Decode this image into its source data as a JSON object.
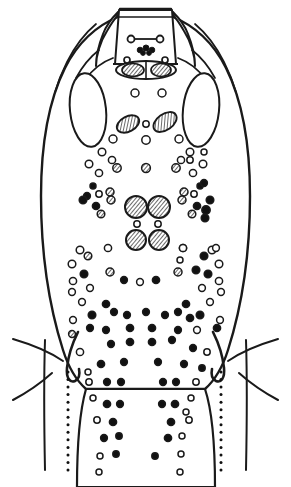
{
  "figure": {
    "caption": "",
    "type": "scientific-line-drawing",
    "background_color": "#ffffff",
    "ink_color": "#1a1a1a",
    "fill_color": "#ffffff",
    "canvas": {
      "width": 291,
      "height": 487
    }
  },
  "style": {
    "stroke": "#1a1a1a",
    "stroke_light": "#2b2b2b",
    "fill_white": "#ffffff",
    "fill_black": "#111111",
    "hatch_stroke": "#1a1a1a",
    "outline_width": 2.2,
    "inner_width": 1.7,
    "dot_stroke_width": 1.5,
    "appendage_width": 2.0
  },
  "body_outline": {
    "name": "idiosoma-outline",
    "path": "M 120 16 L 120 9 L 171 9 L 171 16 C 196 26 214 44 226 68 C 243 102 250 148 250 196 C 250 252 242 306 228 350 C 222 369 214 381 205 389 L 86 389 C 77 381 69 369 63 350 C 49 306 41 252 41 196 C 41 148 48 102 65 68 C 77 44 95 26 120 16 Z"
  },
  "head_plate": {
    "name": "head-plate",
    "path": "M 119 10 L 172 10 L 176 64 L 115 64 Z",
    "top_rim_path": "M 118 17 L 173 17",
    "neck_path": "M 113 64 L 178 64"
  },
  "antennae": [
    {
      "name": "antenna-left",
      "path": "M 118 12 C 112 18 106 26 103 34 C 99 44 96 56 96 66 C 96 56 100 42 107 31 C 111 24 115 18 119 14 Z"
    },
    {
      "name": "antenna-right",
      "path": "M 173 12 C 179 18 185 26 188 34 C 192 44 195 56 195 66 C 195 56 191 42 184 31 C 180 24 176 18 172 14 Z"
    }
  ],
  "shoulder_lines": [
    {
      "name": "shoulder-ridge-left",
      "path": "M 96 24 C 84 34 74 48 67 62 C 62 72 58 82 55 92"
    },
    {
      "name": "shoulder-ridge-right",
      "path": "M 195 24 C 207 34 217 48 224 62 C 229 72 233 82 236 92"
    },
    {
      "name": "shoulder-inner-left",
      "path": "M 99 50 C 90 57 82 67 76 78"
    },
    {
      "name": "shoulder-inner-right",
      "path": "M 192 50 C 201 57 209 67 215 78"
    },
    {
      "name": "clavicle-left",
      "path": "M 113 58 C 102 62 92 70 85 80"
    },
    {
      "name": "clavicle-right",
      "path": "M 178 58 C 189 62 199 70 206 80"
    }
  ],
  "eye_ovals": [
    {
      "name": "dorsal-oval-left",
      "cx": 88,
      "cy": 110,
      "rx": 18,
      "ry": 37,
      "rotation": -6
    },
    {
      "name": "dorsal-oval-right",
      "cx": 201,
      "cy": 110,
      "rx": 18,
      "ry": 37,
      "rotation": 6
    }
  ],
  "head_capsule": {
    "name": "mouthpart-capsule",
    "cx": 146,
    "cy": 70,
    "rx": 30,
    "ry": 9,
    "divider_path": "M 146 62 L 146 78",
    "inner_hatched": [
      {
        "name": "capsule-scutum-left",
        "cx": 133,
        "cy": 70,
        "rx": 11,
        "ry": 6.5,
        "rotation": 0
      },
      {
        "name": "capsule-scutum-right",
        "cx": 161,
        "cy": 70,
        "rx": 10,
        "ry": 6.5,
        "rotation": 0
      }
    ]
  },
  "head_features": {
    "paired_circles": [
      {
        "name": "head-pore-left",
        "cx": 131,
        "cy": 39,
        "r": 3.5
      },
      {
        "name": "head-pore-right",
        "cx": 160,
        "cy": 39,
        "r": 3.5
      }
    ],
    "connector_path": "M 134 39 L 157 39",
    "dark_cluster": [
      {
        "cx": 140,
        "cy": 50,
        "r": 2.8
      },
      {
        "cx": 146,
        "cy": 48,
        "r": 3.0
      },
      {
        "cx": 152,
        "cy": 50,
        "r": 2.8
      },
      {
        "cx": 143,
        "cy": 53,
        "r": 2.4
      },
      {
        "cx": 149,
        "cy": 53,
        "r": 2.4
      }
    ],
    "sub_pores": [
      {
        "cx": 127,
        "cy": 60,
        "r": 3.0
      },
      {
        "cx": 165,
        "cy": 60,
        "r": 3.0
      }
    ]
  },
  "mid_hatched_ovals": [
    {
      "name": "hatched-oval-left",
      "cx": 128,
      "cy": 124,
      "rx": 12,
      "ry": 7.5,
      "rotation": -28
    },
    {
      "name": "hatched-oval-right",
      "cx": 165,
      "cy": 122,
      "rx": 13,
      "ry": 8.0,
      "rotation": -35
    }
  ],
  "central_hatched_circles": [
    {
      "name": "central-disc-upper-left",
      "cx": 136,
      "cy": 207,
      "r": 11
    },
    {
      "name": "central-disc-upper-right",
      "cx": 159,
      "cy": 207,
      "r": 11
    },
    {
      "name": "central-disc-lower-left",
      "cx": 136,
      "cy": 240,
      "r": 10
    },
    {
      "name": "central-disc-lower-right",
      "cx": 159,
      "cy": 240,
      "r": 10
    }
  ],
  "anal_groove": {
    "name": "anal-groove",
    "path": "M 146 373 C 140 379 136 392 135 410 C 134 434 133 462 133 485 M 146 373 C 152 379 156 392 157 410 C 158 434 159 462 159 485"
  },
  "lateral_hooks": [
    {
      "name": "coxal-hook-left",
      "path": "M 78 332 C 72 344 68 358 67 368 C 66 378 70 383 75 381 C 79 379 80 374 79 369"
    },
    {
      "name": "coxal-hook-right",
      "path": "M 213 332 C 219 344 223 358 224 368 C 225 378 221 383 216 381 C 212 379 211 374 212 369"
    }
  ],
  "lobe_edges": [
    {
      "name": "lobe-edge-left",
      "path": "M 45 340 C 44 372 44 420 45 470"
    },
    {
      "name": "lobe-edge-right",
      "path": "M 246 340 C 247 372 247 420 246 470"
    }
  ],
  "appendage_lines": [
    {
      "name": "seta-upper-left",
      "path": "M 13 339 C 30 344 50 352 63 361"
    },
    {
      "name": "seta-lower-left",
      "path": "M 13 400 C 28 392 42 382 52 373"
    },
    {
      "name": "seta-upper-right",
      "path": "M 278 339 C 261 344 241 352 228 361"
    },
    {
      "name": "seta-lower-right",
      "path": "M 278 400 C 263 392 249 382 239 373"
    }
  ],
  "dotted_guides": [
    {
      "name": "dotted-guide-left",
      "x": 68,
      "y_start": 372,
      "y_end": 470,
      "count": 14,
      "r": 1.5
    },
    {
      "name": "dotted-guide-right",
      "x": 221,
      "y_start": 372,
      "y_end": 470,
      "count": 14,
      "r": 1.5
    }
  ],
  "setae_dots": [
    {
      "cx": 135,
      "cy": 93,
      "r": 4.0,
      "kind": "open"
    },
    {
      "cx": 162,
      "cy": 93,
      "r": 4.0,
      "kind": "open"
    },
    {
      "cx": 146,
      "cy": 124,
      "r": 3.2,
      "kind": "open"
    },
    {
      "cx": 113,
      "cy": 139,
      "r": 4.0,
      "kind": "open"
    },
    {
      "cx": 146,
      "cy": 140,
      "r": 4.2,
      "kind": "open"
    },
    {
      "cx": 179,
      "cy": 139,
      "r": 4.0,
      "kind": "open"
    },
    {
      "cx": 102,
      "cy": 152,
      "r": 3.8,
      "kind": "open"
    },
    {
      "cx": 190,
      "cy": 152,
      "r": 3.8,
      "kind": "open"
    },
    {
      "cx": 112,
      "cy": 160,
      "r": 3.6,
      "kind": "open"
    },
    {
      "cx": 181,
      "cy": 160,
      "r": 3.6,
      "kind": "open"
    },
    {
      "cx": 89,
      "cy": 164,
      "r": 3.8,
      "kind": "open"
    },
    {
      "cx": 203,
      "cy": 164,
      "r": 3.8,
      "kind": "open"
    },
    {
      "cx": 117,
      "cy": 168,
      "r": 4.2,
      "kind": "hatch"
    },
    {
      "cx": 176,
      "cy": 168,
      "r": 4.2,
      "kind": "hatch"
    },
    {
      "cx": 146,
      "cy": 168,
      "r": 4.4,
      "kind": "hatch"
    },
    {
      "cx": 99,
      "cy": 173,
      "r": 3.6,
      "kind": "open"
    },
    {
      "cx": 193,
      "cy": 173,
      "r": 3.6,
      "kind": "open"
    },
    {
      "cx": 190,
      "cy": 160,
      "r": 3.2,
      "kind": "open"
    },
    {
      "cx": 204,
      "cy": 152,
      "r": 3.0,
      "kind": "open"
    },
    {
      "cx": 93,
      "cy": 186,
      "r": 3.0,
      "kind": "solid"
    },
    {
      "cx": 200,
      "cy": 186,
      "r": 3.0,
      "kind": "solid"
    },
    {
      "cx": 99,
      "cy": 194,
      "r": 3.2,
      "kind": "open"
    },
    {
      "cx": 194,
      "cy": 194,
      "r": 3.2,
      "kind": "open"
    },
    {
      "cx": 110,
      "cy": 192,
      "r": 4.0,
      "kind": "hatch"
    },
    {
      "cx": 184,
      "cy": 192,
      "r": 4.0,
      "kind": "hatch"
    },
    {
      "cx": 204,
      "cy": 183,
      "r": 3.4,
      "kind": "solid"
    },
    {
      "cx": 87,
      "cy": 196,
      "r": 3.4,
      "kind": "solid"
    },
    {
      "cx": 83,
      "cy": 200,
      "r": 3.8,
      "kind": "solid"
    },
    {
      "cx": 210,
      "cy": 200,
      "r": 3.8,
      "kind": "solid"
    },
    {
      "cx": 111,
      "cy": 200,
      "r": 4.0,
      "kind": "hatch"
    },
    {
      "cx": 182,
      "cy": 200,
      "r": 4.0,
      "kind": "hatch"
    },
    {
      "cx": 96,
      "cy": 206,
      "r": 3.6,
      "kind": "solid"
    },
    {
      "cx": 197,
      "cy": 206,
      "r": 3.6,
      "kind": "solid"
    },
    {
      "cx": 101,
      "cy": 214,
      "r": 3.8,
      "kind": "hatch"
    },
    {
      "cx": 192,
      "cy": 214,
      "r": 3.8,
      "kind": "hatch"
    },
    {
      "cx": 206,
      "cy": 210,
      "r": 4.2,
      "kind": "solid"
    },
    {
      "cx": 205,
      "cy": 218,
      "r": 3.8,
      "kind": "solid"
    },
    {
      "cx": 137,
      "cy": 224,
      "r": 3.2,
      "kind": "open"
    },
    {
      "cx": 158,
      "cy": 224,
      "r": 3.2,
      "kind": "open"
    },
    {
      "cx": 80,
      "cy": 250,
      "r": 3.8,
      "kind": "open"
    },
    {
      "cx": 212,
      "cy": 250,
      "r": 3.8,
      "kind": "open"
    },
    {
      "cx": 108,
      "cy": 248,
      "r": 3.6,
      "kind": "open"
    },
    {
      "cx": 183,
      "cy": 248,
      "r": 3.6,
      "kind": "open"
    },
    {
      "cx": 183,
      "cy": 248,
      "r": 3.6,
      "kind": "open"
    },
    {
      "cx": 72,
      "cy": 264,
      "r": 3.8,
      "kind": "open"
    },
    {
      "cx": 219,
      "cy": 264,
      "r": 3.8,
      "kind": "open"
    },
    {
      "cx": 88,
      "cy": 256,
      "r": 3.8,
      "kind": "hatch"
    },
    {
      "cx": 204,
      "cy": 256,
      "r": 3.8,
      "kind": "solid"
    },
    {
      "cx": 216,
      "cy": 248,
      "r": 3.4,
      "kind": "open"
    },
    {
      "cx": 180,
      "cy": 260,
      "r": 3.0,
      "kind": "open"
    },
    {
      "cx": 84,
      "cy": 274,
      "r": 3.8,
      "kind": "solid"
    },
    {
      "cx": 208,
      "cy": 274,
      "r": 3.8,
      "kind": "solid"
    },
    {
      "cx": 73,
      "cy": 281,
      "r": 3.6,
      "kind": "open"
    },
    {
      "cx": 219,
      "cy": 281,
      "r": 3.6,
      "kind": "open"
    },
    {
      "cx": 110,
      "cy": 272,
      "r": 4.0,
      "kind": "hatch"
    },
    {
      "cx": 178,
      "cy": 272,
      "r": 4.0,
      "kind": "hatch"
    },
    {
      "cx": 196,
      "cy": 270,
      "r": 3.8,
      "kind": "solid"
    },
    {
      "cx": 124,
      "cy": 280,
      "r": 3.4,
      "kind": "solid"
    },
    {
      "cx": 140,
      "cy": 282,
      "r": 3.4,
      "kind": "open"
    },
    {
      "cx": 156,
      "cy": 280,
      "r": 3.6,
      "kind": "solid"
    },
    {
      "cx": 90,
      "cy": 288,
      "r": 3.4,
      "kind": "open"
    },
    {
      "cx": 202,
      "cy": 288,
      "r": 3.4,
      "kind": "open"
    },
    {
      "cx": 72,
      "cy": 292,
      "r": 3.4,
      "kind": "open"
    },
    {
      "cx": 221,
      "cy": 292,
      "r": 3.4,
      "kind": "open"
    },
    {
      "cx": 106,
      "cy": 304,
      "r": 3.6,
      "kind": "solid"
    },
    {
      "cx": 186,
      "cy": 304,
      "r": 3.6,
      "kind": "solid"
    },
    {
      "cx": 82,
      "cy": 302,
      "r": 3.4,
      "kind": "open"
    },
    {
      "cx": 210,
      "cy": 302,
      "r": 3.4,
      "kind": "open"
    },
    {
      "cx": 92,
      "cy": 315,
      "r": 3.8,
      "kind": "solid"
    },
    {
      "cx": 200,
      "cy": 315,
      "r": 3.8,
      "kind": "solid"
    },
    {
      "cx": 114,
      "cy": 312,
      "r": 3.4,
      "kind": "solid"
    },
    {
      "cx": 178,
      "cy": 312,
      "r": 3.4,
      "kind": "solid"
    },
    {
      "cx": 127,
      "cy": 315,
      "r": 3.4,
      "kind": "solid"
    },
    {
      "cx": 165,
      "cy": 315,
      "r": 3.4,
      "kind": "solid"
    },
    {
      "cx": 146,
      "cy": 312,
      "r": 3.4,
      "kind": "solid"
    },
    {
      "cx": 190,
      "cy": 318,
      "r": 3.6,
      "kind": "solid"
    },
    {
      "cx": 73,
      "cy": 320,
      "r": 3.4,
      "kind": "open"
    },
    {
      "cx": 220,
      "cy": 320,
      "r": 3.4,
      "kind": "open"
    },
    {
      "cx": 130,
      "cy": 328,
      "r": 3.6,
      "kind": "solid"
    },
    {
      "cx": 152,
      "cy": 328,
      "r": 3.6,
      "kind": "solid"
    },
    {
      "cx": 106,
      "cy": 330,
      "r": 3.4,
      "kind": "solid"
    },
    {
      "cx": 178,
      "cy": 330,
      "r": 3.4,
      "kind": "solid"
    },
    {
      "cx": 197,
      "cy": 330,
      "r": 3.4,
      "kind": "open"
    },
    {
      "cx": 217,
      "cy": 328,
      "r": 3.6,
      "kind": "solid"
    },
    {
      "cx": 72,
      "cy": 334,
      "r": 3.4,
      "kind": "hatch"
    },
    {
      "cx": 90,
      "cy": 328,
      "r": 3.4,
      "kind": "solid"
    },
    {
      "cx": 130,
      "cy": 342,
      "r": 3.6,
      "kind": "solid"
    },
    {
      "cx": 152,
      "cy": 342,
      "r": 3.6,
      "kind": "solid"
    },
    {
      "cx": 172,
      "cy": 340,
      "r": 3.4,
      "kind": "solid"
    },
    {
      "cx": 111,
      "cy": 344,
      "r": 3.4,
      "kind": "solid"
    },
    {
      "cx": 193,
      "cy": 348,
      "r": 3.4,
      "kind": "solid"
    },
    {
      "cx": 207,
      "cy": 352,
      "r": 3.2,
      "kind": "open"
    },
    {
      "cx": 80,
      "cy": 352,
      "r": 3.6,
      "kind": "open"
    },
    {
      "cx": 101,
      "cy": 364,
      "r": 3.6,
      "kind": "solid"
    },
    {
      "cx": 124,
      "cy": 362,
      "r": 3.4,
      "kind": "solid"
    },
    {
      "cx": 158,
      "cy": 362,
      "r": 3.4,
      "kind": "solid"
    },
    {
      "cx": 184,
      "cy": 364,
      "r": 3.4,
      "kind": "solid"
    },
    {
      "cx": 202,
      "cy": 368,
      "r": 3.2,
      "kind": "solid"
    },
    {
      "cx": 88,
      "cy": 372,
      "r": 3.0,
      "kind": "open"
    },
    {
      "cx": 89,
      "cy": 382,
      "r": 3.2,
      "kind": "open"
    },
    {
      "cx": 107,
      "cy": 382,
      "r": 3.4,
      "kind": "solid"
    },
    {
      "cx": 121,
      "cy": 382,
      "r": 3.4,
      "kind": "solid"
    },
    {
      "cx": 163,
      "cy": 382,
      "r": 3.4,
      "kind": "solid"
    },
    {
      "cx": 176,
      "cy": 382,
      "r": 3.4,
      "kind": "solid"
    },
    {
      "cx": 196,
      "cy": 382,
      "r": 3.2,
      "kind": "open"
    },
    {
      "cx": 107,
      "cy": 404,
      "r": 3.6,
      "kind": "solid"
    },
    {
      "cx": 120,
      "cy": 404,
      "r": 3.4,
      "kind": "solid"
    },
    {
      "cx": 162,
      "cy": 404,
      "r": 3.4,
      "kind": "solid"
    },
    {
      "cx": 175,
      "cy": 404,
      "r": 3.6,
      "kind": "solid"
    },
    {
      "cx": 93,
      "cy": 398,
      "r": 3.0,
      "kind": "open"
    },
    {
      "cx": 191,
      "cy": 398,
      "r": 3.0,
      "kind": "open"
    },
    {
      "cx": 186,
      "cy": 412,
      "r": 3.0,
      "kind": "open"
    },
    {
      "cx": 97,
      "cy": 420,
      "r": 3.2,
      "kind": "open"
    },
    {
      "cx": 113,
      "cy": 422,
      "r": 3.6,
      "kind": "solid"
    },
    {
      "cx": 171,
      "cy": 422,
      "r": 3.6,
      "kind": "solid"
    },
    {
      "cx": 189,
      "cy": 420,
      "r": 3.2,
      "kind": "open"
    },
    {
      "cx": 104,
      "cy": 438,
      "r": 3.4,
      "kind": "solid"
    },
    {
      "cx": 119,
      "cy": 436,
      "r": 3.2,
      "kind": "solid"
    },
    {
      "cx": 168,
      "cy": 438,
      "r": 3.6,
      "kind": "solid"
    },
    {
      "cx": 182,
      "cy": 436,
      "r": 3.0,
      "kind": "open"
    },
    {
      "cx": 100,
      "cy": 456,
      "r": 3.0,
      "kind": "open"
    },
    {
      "cx": 116,
      "cy": 454,
      "r": 3.2,
      "kind": "solid"
    },
    {
      "cx": 155,
      "cy": 456,
      "r": 3.2,
      "kind": "solid"
    },
    {
      "cx": 181,
      "cy": 454,
      "r": 3.0,
      "kind": "open"
    },
    {
      "cx": 99,
      "cy": 472,
      "r": 3.0,
      "kind": "open"
    },
    {
      "cx": 180,
      "cy": 472,
      "r": 3.0,
      "kind": "open"
    }
  ],
  "legend": {
    "open_label": "open pore",
    "solid_label": "solid seta",
    "hatch_label": "hatched disc"
  }
}
